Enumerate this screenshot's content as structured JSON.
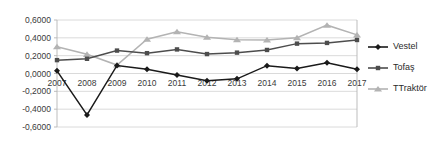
{
  "chart_data": {
    "type": "line",
    "title": "",
    "xlabel": "",
    "ylabel": "",
    "categories": [
      "2007",
      "2008",
      "2009",
      "2010",
      "2011",
      "2012",
      "2013",
      "2014",
      "2015",
      "2016",
      "2017"
    ],
    "ylim": [
      -0.6,
      0.6
    ],
    "y_ticks": [
      "-0,6000",
      "-0,4000",
      "-0,2000",
      "0,0000",
      "0,2000",
      "0,4000",
      "0,6000"
    ],
    "y_tick_values": [
      -0.6,
      -0.4,
      -0.2,
      0.0,
      0.2,
      0.4,
      0.6
    ],
    "grid": true,
    "legend_position": "right",
    "series": [
      {
        "name": "Vestel",
        "color": "#1a1a1a",
        "marker": "diamond",
        "values": [
          0.03,
          -0.465,
          0.09,
          0.048,
          -0.018,
          -0.08,
          -0.06,
          0.088,
          0.057,
          0.12,
          0.047
        ]
      },
      {
        "name": "Tofaş",
        "color": "#4d4d4d",
        "marker": "square",
        "values": [
          0.15,
          0.165,
          0.257,
          0.228,
          0.27,
          0.218,
          0.234,
          0.264,
          0.335,
          0.343,
          0.376
        ]
      },
      {
        "name": "TTraktör",
        "color": "#b3b3b3",
        "marker": "triangle",
        "values": [
          0.3,
          0.215,
          0.095,
          0.385,
          0.468,
          0.407,
          0.378,
          0.375,
          0.401,
          0.542,
          0.433
        ]
      }
    ]
  },
  "legend": {
    "items": [
      {
        "label": "Vestel"
      },
      {
        "label": "Tofaş"
      },
      {
        "label": "TTraktör"
      }
    ]
  }
}
